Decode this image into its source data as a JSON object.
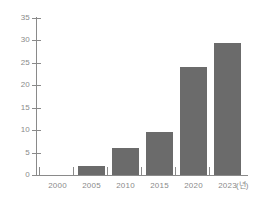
{
  "chart_data": {
    "type": "bar",
    "title": "",
    "subtitle": "",
    "xlabel": "(년)",
    "ylabel": "",
    "categories": [
      "2000",
      "2005",
      "2010",
      "2015",
      "2020",
      "2023"
    ],
    "values": [
      0,
      2,
      6,
      9.5,
      24,
      29.5
    ],
    "series": [
      {
        "name": "",
        "values": [
          0,
          2,
          6,
          9.5,
          24,
          29.5
        ]
      }
    ],
    "ylim": [
      0,
      35
    ],
    "y_ticks": [
      0,
      5,
      10,
      15,
      20,
      25,
      30,
      35
    ],
    "y_tick_labels": [
      "0",
      "5",
      "10",
      "15",
      "20",
      "25",
      "30",
      "35"
    ],
    "x_tick_labels": [
      "2000",
      "2005",
      "2010",
      "2015",
      "2020",
      "2023"
    ],
    "grid": false,
    "legend": false,
    "legend_position": "none",
    "annotations": [],
    "colors": {
      "bar": "#6b6b6b",
      "axis": "#8a8a8a",
      "tick_label": "#8a8a8a",
      "background": "#ffffff"
    }
  }
}
